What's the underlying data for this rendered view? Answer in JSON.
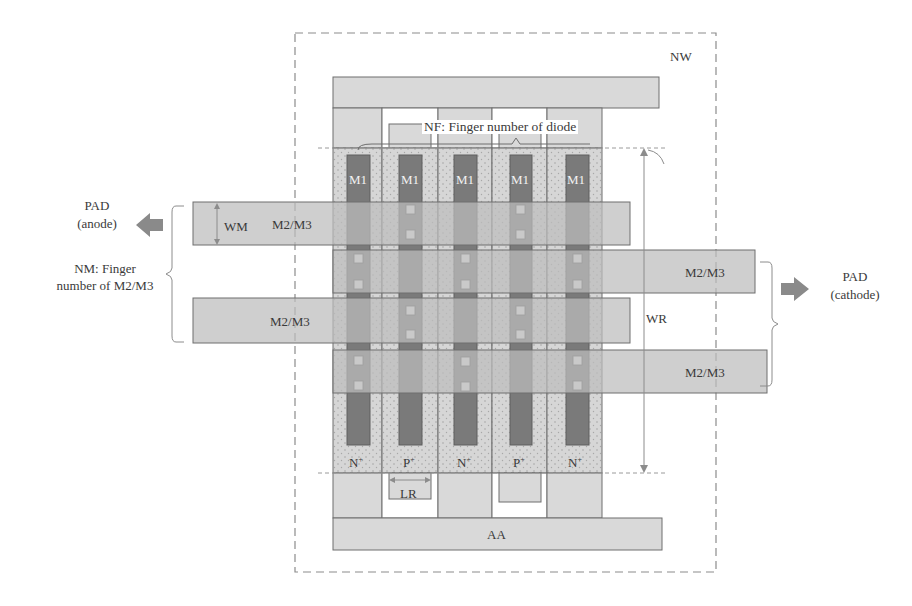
{
  "diagram": {
    "type": "diode layout schematic (top view)",
    "regions": {
      "nwell": {
        "label": "NW"
      },
      "active_top": {
        "label": ""
      },
      "active_bottom": {
        "label": "AA"
      }
    },
    "fingers": [
      {
        "doping": "N+",
        "doping_base": "N",
        "doping_sup": "+",
        "metal": "M1"
      },
      {
        "doping": "P+",
        "doping_base": "P",
        "doping_sup": "+",
        "metal": "M1"
      },
      {
        "doping": "N+",
        "doping_base": "N",
        "doping_sup": "+",
        "metal": "M1"
      },
      {
        "doping": "P+",
        "doping_base": "P",
        "doping_sup": "+",
        "metal": "M1"
      },
      {
        "doping": "N+",
        "doping_base": "N",
        "doping_sup": "+",
        "metal": "M1"
      }
    ],
    "metal_bars": [
      {
        "label": "M2/M3",
        "side": "anode"
      },
      {
        "label": "M2/M3",
        "side": "cathode"
      },
      {
        "label": "M2/M3",
        "side": "anode"
      },
      {
        "label": "M2/M3",
        "side": "cathode"
      }
    ],
    "annotations": {
      "nf": "NF: Finger number of diode",
      "nm_line1": "NM: Finger",
      "nm_line2": "number of M2/M3",
      "wm": "WM",
      "wr": "WR",
      "lr": "LR"
    },
    "pads": {
      "anode_line1": "PAD",
      "anode_line2": "(anode)",
      "cathode_line1": "PAD",
      "cathode_line2": "(cathode)"
    },
    "colors": {
      "light_fill": "#d9d9d9",
      "dotted_fill": "#cfcfcf",
      "m1_fill": "#7a7a7a",
      "m2_fill": "#c4c4c4",
      "via_fill": "#bdbdbd",
      "arrow_fill": "#8a8a8a",
      "outline": "#6e6e6e",
      "dashed": "#8c8c8c"
    }
  }
}
